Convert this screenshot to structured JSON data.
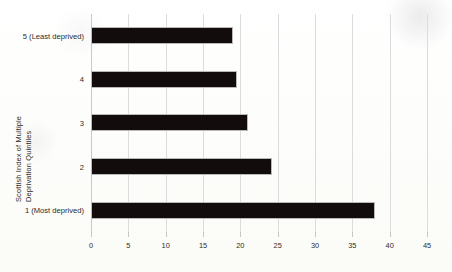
{
  "chart_data": {
    "type": "bar",
    "orientation": "horizontal",
    "title": "",
    "xlabel": "",
    "ylabel": "Scottish Index of Multiple Deprivation Quintiles",
    "ylabel_lines": [
      "Scottish Index of Multiple",
      "Deprivation Quintiles"
    ],
    "categories": [
      "5 (Least deprived)",
      "4",
      "3",
      "2",
      "1 (Most deprived)"
    ],
    "values": [
      19,
      19.5,
      21,
      24.3,
      38
    ],
    "xlim": [
      0,
      45
    ],
    "xticks": [
      0,
      5,
      10,
      15,
      20,
      25,
      30,
      35,
      40,
      45
    ],
    "xtick_labels": [
      "0",
      "5",
      "10",
      "15",
      "20",
      "25",
      "30",
      "35",
      "40",
      "45"
    ],
    "grid": "vertical",
    "legend": "none",
    "bar_color": "#120c0c",
    "gridline_color": "#dcdcdc",
    "background_color": "#fdfdfb"
  }
}
